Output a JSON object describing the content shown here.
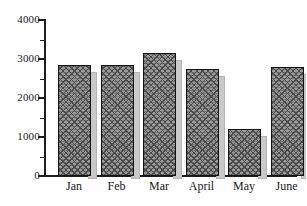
{
  "chart_data": {
    "type": "bar",
    "title": "",
    "subtitle": "",
    "xlabel": "",
    "ylabel": "",
    "categories": [
      "Jan",
      "Feb",
      "Mar",
      "April",
      "May",
      "June"
    ],
    "values": [
      2850,
      2850,
      3150,
      2750,
      1200,
      2800
    ],
    "series": [
      {
        "name": "",
        "values": [
          2850,
          2850,
          3150,
          2750,
          1200,
          2800
        ]
      }
    ],
    "ylim": [
      0,
      4000
    ],
    "y_ticks": [
      0,
      1000,
      2000,
      3000,
      4000
    ],
    "y_tick_labels": [
      "0",
      "1000",
      "2000",
      "3000",
      "4000"
    ],
    "y_minor_ticks": [
      500,
      1500,
      2500,
      3500
    ],
    "grid": false,
    "legend": null,
    "legend_position": "none",
    "bar_style": "crosshatch-3d-shadow",
    "colors": {
      "bar_fill": "#9a9a9a",
      "bar_hatch": "#4a4a4a",
      "bar_border": "#141414",
      "bar_shadow": "#c9c9c9",
      "axis": "#1d1d1d",
      "text": "#1a1a1a",
      "background": "#fefefe"
    }
  }
}
